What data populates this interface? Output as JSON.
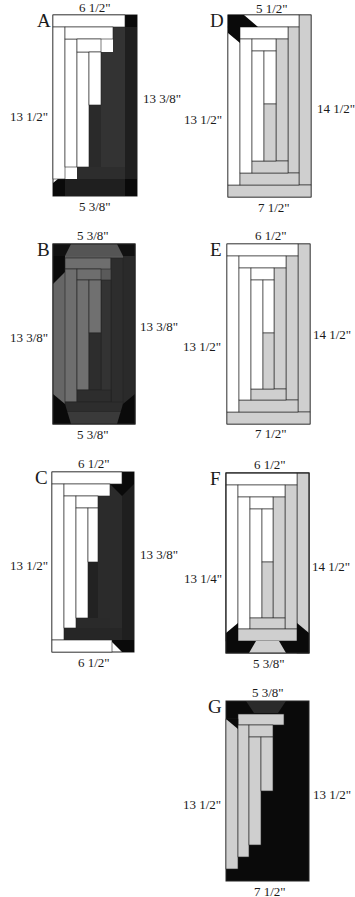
{
  "colors": {
    "white": "#ffffff",
    "light": "#cfcfcf",
    "medium": "#6e6e6e",
    "dark": "#333333",
    "darker": "#1f1f1f",
    "black": "#0a0a0a",
    "outline": "#222222"
  },
  "blocks": [
    {
      "id": "A",
      "letter": "A",
      "top": "6 1/2\"",
      "bottom": "5 3/8\"",
      "left": "13 1/2\"",
      "right": "13 3/8\""
    },
    {
      "id": "B",
      "letter": "B",
      "top": "5 3/8\"",
      "bottom": "5 3/8\"",
      "left": "13 3/8\"",
      "right": "13 3/8\""
    },
    {
      "id": "C",
      "letter": "C",
      "top": "6 1/2\"",
      "bottom": "6 1/2\"",
      "left": "13 1/2\"",
      "right": "13 3/8\""
    },
    {
      "id": "D",
      "letter": "D",
      "top": "5 1/2\"",
      "bottom": "7 1/2\"",
      "left": "13 1/2\"",
      "right": "14 1/2\""
    },
    {
      "id": "E",
      "letter": "E",
      "top": "6 1/2\"",
      "bottom": "7 1/2\"",
      "left": "13 1/2\"",
      "right": "14 1/2\""
    },
    {
      "id": "F",
      "letter": "F",
      "top": "6 1/2\"",
      "bottom": "5 3/8\"",
      "left": "13 1/4\"",
      "right": "14 1/2\""
    },
    {
      "id": "G",
      "letter": "G",
      "top": "5 3/8\"",
      "bottom": "7 1/2\"",
      "left": "13 1/2\"",
      "right": "13 1/2\""
    }
  ]
}
